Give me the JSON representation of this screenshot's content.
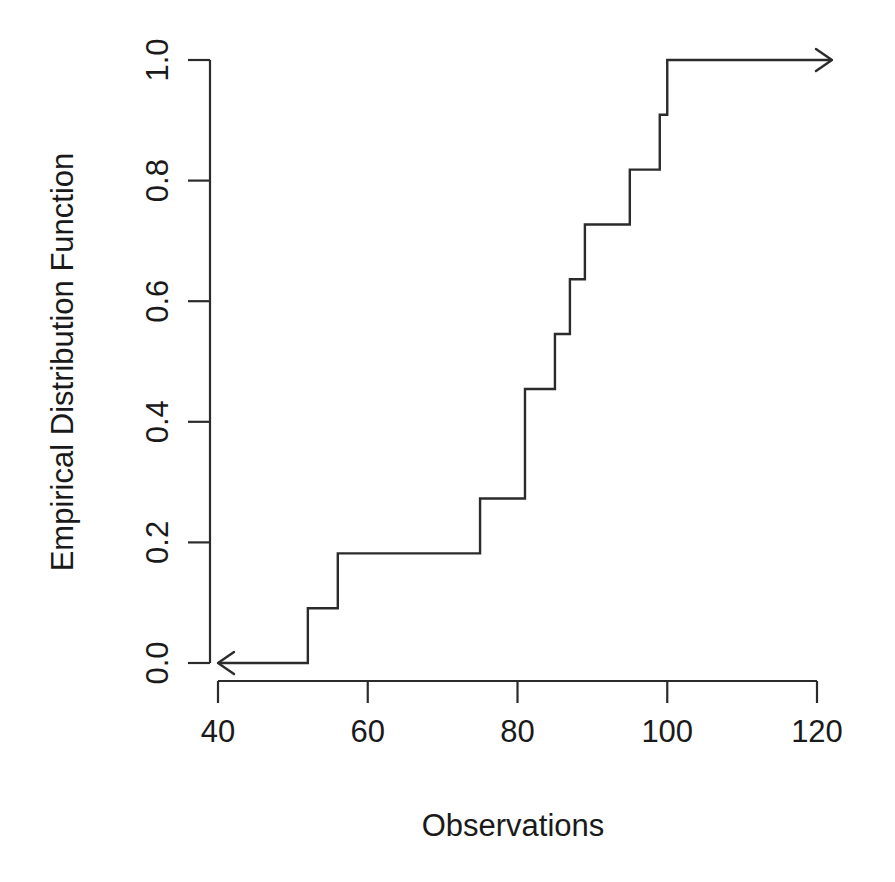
{
  "chart_data": {
    "type": "line",
    "subtype": "step-ecdf",
    "title": "",
    "xlabel": "Observations",
    "ylabel": "Empirical Distribution Function",
    "xlim": [
      40,
      120
    ],
    "ylim": [
      0.0,
      1.0
    ],
    "xticks": [
      40,
      60,
      80,
      100,
      120
    ],
    "xtick_labels": [
      "40",
      "60",
      "80",
      "100",
      "120"
    ],
    "yticks": [
      0.0,
      0.2,
      0.4,
      0.6,
      0.8,
      1.0
    ],
    "ytick_labels": [
      "0.0",
      "0.2",
      "0.4",
      "0.6",
      "0.8",
      "1.0"
    ],
    "grid": false,
    "legend": null,
    "n_observations": 11,
    "observations": [
      52,
      56,
      75,
      81,
      85,
      87,
      89,
      95,
      99,
      100,
      100
    ],
    "jump_points": [
      {
        "x": 52,
        "y": 0.0909
      },
      {
        "x": 56,
        "y": 0.1818
      },
      {
        "x": 75,
        "y": 0.2727
      },
      {
        "x": 81,
        "y": 0.4545
      },
      {
        "x": 85,
        "y": 0.5455
      },
      {
        "x": 87,
        "y": 0.6364
      },
      {
        "x": 89,
        "y": 0.7273
      },
      {
        "x": 95,
        "y": 0.8182
      },
      {
        "x": 99,
        "y": 0.9091
      },
      {
        "x": 100,
        "y": 1.0
      }
    ],
    "left_tail": {
      "y": 0.0,
      "from_x": 52,
      "to_x": 40,
      "arrow": true
    },
    "right_tail": {
      "y": 1.0,
      "from_x": 100,
      "to_x": 122,
      "arrow": true
    },
    "line_color": "#2b2b2b",
    "background_color": "#ffffff"
  },
  "axes": {
    "x_axis_name": "x-axis",
    "y_axis_name": "y-axis"
  }
}
